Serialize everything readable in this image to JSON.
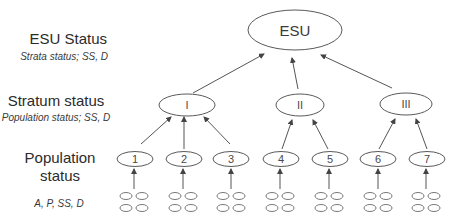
{
  "labels": {
    "esu_title": "ESU Status",
    "esu_sub": "Strata status; SS, D",
    "stratum_title": "Stratum status",
    "stratum_sub": "Population status; SS, D",
    "population_title_line1": "Population",
    "population_title_line2": "status",
    "population_sub": "A, P, SS, D"
  },
  "nodes": {
    "esu": "ESU",
    "strata": [
      "I",
      "II",
      "III"
    ],
    "populations": [
      "1",
      "2",
      "3",
      "4",
      "5",
      "6",
      "7"
    ]
  },
  "colors": {
    "stroke": "#5a5a5a",
    "text": "#2b2b2b",
    "background": "#ffffff"
  }
}
